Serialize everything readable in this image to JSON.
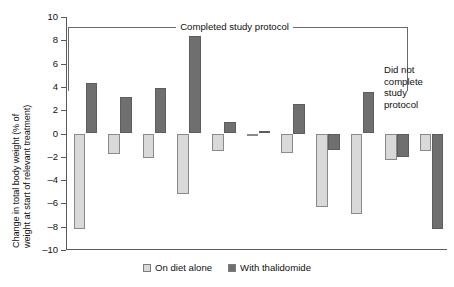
{
  "chart_data": {
    "type": "bar",
    "title": "",
    "xlabel": "",
    "ylabel": "Change in total body weight (% of weight at start of relevant treatment)",
    "ylabel_line1": "Change in total body weight (% of",
    "ylabel_line2": "weight at start of relevant treatment)",
    "ylim": [
      -10,
      10
    ],
    "ytick_labels": [
      "10",
      "8",
      "6",
      "4",
      "2",
      "0",
      "–2",
      "–4",
      "–6",
      "–8",
      "–10"
    ],
    "ytick_values": [
      10,
      8,
      6,
      4,
      2,
      0,
      -2,
      -4,
      -6,
      -8,
      -10
    ],
    "grid": false,
    "legend_position": "bottom-center",
    "categories": [
      "1",
      "2",
      "3",
      "4",
      "5",
      "6",
      "7",
      "8",
      "9",
      "10",
      "11"
    ],
    "series": [
      {
        "name": "On diet alone",
        "color": "#d9d9d9",
        "values": [
          -8.2,
          -1.8,
          -2.1,
          -5.2,
          -1.5,
          -0.1,
          -1.7,
          -6.3,
          -6.9,
          -2.3,
          -1.5
        ]
      },
      {
        "name": "With thalidomide",
        "color": "#6f6f6f",
        "values": [
          4.3,
          3.1,
          3.9,
          8.4,
          1.0,
          0.2,
          2.5,
          -1.4,
          3.6,
          -2.0,
          -8.2
        ]
      }
    ],
    "annotations": [
      {
        "name": "completed-study-protocol-bracket",
        "text": "Completed study protocol",
        "spans_categories": [
          1,
          10
        ]
      },
      {
        "name": "did-not-complete-note",
        "text_lines": [
          "Did not",
          "complete",
          "study",
          "protocol"
        ],
        "spans_categories": [
          11,
          11
        ]
      }
    ]
  },
  "legend": {
    "items": [
      {
        "label": "On diet alone",
        "swatch": "light-gray-square"
      },
      {
        "label": "With thalidomide",
        "swatch": "dark-gray-square"
      }
    ]
  },
  "annotations": {
    "bracket_label": "Completed study protocol",
    "note_line1": "Did not",
    "note_line2": "complete",
    "note_line3": "study",
    "note_line4": "protocol"
  },
  "axis": {
    "y_title_line1": "Change in total body weight (% of",
    "y_title_line2": "weight at start of relevant treatment)",
    "ticks": [
      "10",
      "8",
      "6",
      "4",
      "2",
      "0",
      "–2",
      "–4",
      "–6",
      "–8",
      "–10"
    ]
  },
  "colors": {
    "light_bar": "#d9d9d9",
    "dark_bar": "#6f6f6f",
    "axis": "#5a5a5a",
    "text": "#111111",
    "background": "#ffffff"
  }
}
